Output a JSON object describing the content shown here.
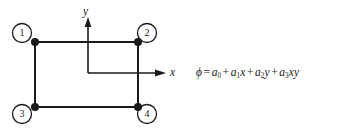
{
  "figure": {
    "background_color": "#ffffff",
    "line_color": "#1a1a1a"
  },
  "nodes": [
    {
      "id": "1",
      "label": "1",
      "corner": "top-left",
      "dot_x": 35,
      "dot_y": 42,
      "circle_x": 22,
      "circle_y": 33
    },
    {
      "id": "2",
      "label": "2",
      "corner": "top-right",
      "dot_x": 138,
      "dot_y": 42,
      "circle_x": 147,
      "circle_y": 33
    },
    {
      "id": "3",
      "label": "3",
      "corner": "bottom-left",
      "dot_x": 35,
      "dot_y": 107,
      "circle_x": 22,
      "circle_y": 114
    },
    {
      "id": "4",
      "label": "4",
      "corner": "bottom-right",
      "dot_x": 138,
      "dot_y": 107,
      "circle_x": 147,
      "circle_y": 114
    }
  ],
  "axes": {
    "origin_x": 88,
    "origin_y": 73,
    "x_axis": {
      "label": "x",
      "tip_x": 166,
      "tip_y": 73
    },
    "y_axis": {
      "label": "y",
      "tip_x": 88,
      "tip_y": 18
    }
  },
  "equation": {
    "phi": "ϕ",
    "equals": "=",
    "plus": "+",
    "terms": [
      {
        "coefficient": "a",
        "subscript": "0",
        "variable": ""
      },
      {
        "coefficient": "a",
        "subscript": "1",
        "variable": "x"
      },
      {
        "coefficient": "a",
        "subscript": "2",
        "variable": "y"
      },
      {
        "coefficient": "a",
        "subscript": "3",
        "variable": "xy"
      }
    ],
    "full_text": "ϕ = a0 + a1x + a2y + a3xy"
  }
}
